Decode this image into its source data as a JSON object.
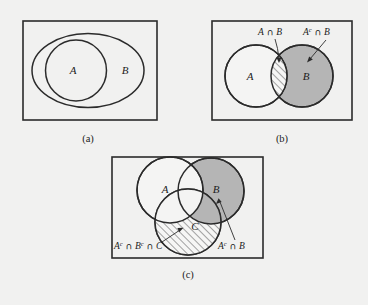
{
  "figure": {
    "background_color": "#f1f1f0",
    "stroke_color": "#2b2b2b",
    "gray_fill": "#b5b5b5",
    "white_fill": "#f4f4f3",
    "hatch_color": "#3a3a3a"
  },
  "panels": [
    {
      "id": "a",
      "caption": "(a)",
      "labels": {
        "inner_set": "A",
        "outer_set": "B"
      },
      "shapes": [
        {
          "name": "universe-rectangle",
          "type": "rect"
        },
        {
          "name": "set-b-ellipse",
          "type": "ellipse",
          "fill": "none"
        },
        {
          "name": "set-a-circle",
          "type": "circle",
          "fill": "none"
        }
      ]
    },
    {
      "id": "b",
      "caption": "(b)",
      "labels": {
        "set_a": "A",
        "set_b": "B"
      },
      "annotations": [
        {
          "name": "a-intersect-b",
          "parts": [
            {
              "text": "A",
              "style": "italic"
            },
            {
              "text": " ∩ ",
              "style": "op"
            },
            {
              "text": "B",
              "style": "italic"
            }
          ],
          "plain": "A ∩ B"
        },
        {
          "name": "a-complement-intersect-b",
          "parts": [
            {
              "text": "A",
              "style": "italic"
            },
            {
              "text": "c",
              "style": "sup"
            },
            {
              "text": " ∩ ",
              "style": "op"
            },
            {
              "text": "B",
              "style": "italic"
            }
          ],
          "plain": "Aᶜ ∩ B"
        }
      ],
      "shapes": [
        {
          "name": "universe-rectangle",
          "type": "rect"
        },
        {
          "name": "set-a-circle",
          "type": "circle",
          "fill": "white"
        },
        {
          "name": "set-b-circle",
          "type": "circle",
          "fill": "gray"
        },
        {
          "name": "intersection-lens",
          "type": "lens",
          "fill": "hatched"
        }
      ]
    },
    {
      "id": "c",
      "caption": "(c)",
      "labels": {
        "set_a": "A",
        "set_b": "B",
        "set_c": "C"
      },
      "annotations": [
        {
          "name": "a-comp-intersect-b-comp-intersect-c",
          "parts": [
            {
              "text": "A",
              "style": "italic"
            },
            {
              "text": "c",
              "style": "sup"
            },
            {
              "text": " ∩ ",
              "style": "op"
            },
            {
              "text": "B",
              "style": "italic"
            },
            {
              "text": "c",
              "style": "sup"
            },
            {
              "text": " ∩ ",
              "style": "op"
            },
            {
              "text": "C",
              "style": "italic"
            }
          ],
          "plain": "Aᶜ ∩ Bᶜ ∩ C"
        },
        {
          "name": "a-complement-intersect-b",
          "parts": [
            {
              "text": "A",
              "style": "italic"
            },
            {
              "text": "c",
              "style": "sup"
            },
            {
              "text": " ∩ ",
              "style": "op"
            },
            {
              "text": "B",
              "style": "italic"
            }
          ],
          "plain": "Aᶜ ∩ B"
        }
      ],
      "shapes": [
        {
          "name": "universe-rectangle",
          "type": "rect"
        },
        {
          "name": "set-a-circle",
          "type": "circle",
          "fill": "white"
        },
        {
          "name": "set-b-circle",
          "type": "circle",
          "fill": "gray"
        },
        {
          "name": "set-c-circle",
          "type": "circle",
          "fill": "hatched-minus-a-b"
        }
      ]
    }
  ]
}
